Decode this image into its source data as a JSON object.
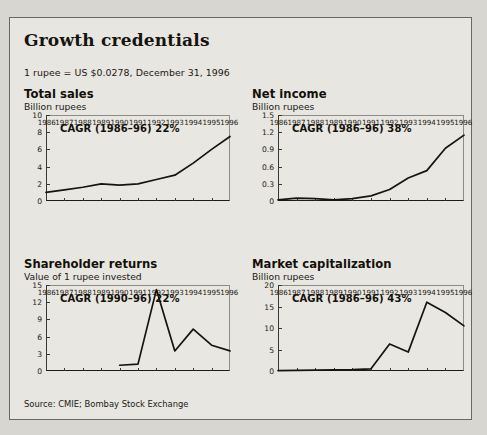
{
  "panel": {
    "title": "Growth credentials",
    "note": "1 rupee = US $0.0278, December 31, 1996",
    "source": "Source: CMIE; Bombay Stock Exchange"
  },
  "chart_data": [
    {
      "id": "total-sales",
      "type": "line",
      "title": "Total sales",
      "subtitle": "Billion rupees",
      "annotation": "CAGR (1986–96) 22%",
      "xlabel": "",
      "ylabel": "Billion rupees",
      "grid": false,
      "legend": "none",
      "ylim": [
        0,
        10
      ],
      "yticks": [
        0,
        2,
        4,
        6,
        8,
        10
      ],
      "ytick_labels": [
        "0",
        "2",
        "4",
        "6",
        "8",
        "10"
      ],
      "categories": [
        1986,
        1987,
        1988,
        1989,
        1990,
        1991,
        1992,
        1993,
        1994,
        1995,
        1996
      ],
      "tick_labels": [
        "1986",
        "1987",
        "1988",
        "1989",
        "1990",
        "1991",
        "1992",
        "1993",
        "1994",
        "1995",
        "1996"
      ],
      "values": [
        1.0,
        1.3,
        1.6,
        2.0,
        1.85,
        2.0,
        2.5,
        3.0,
        4.4,
        6.0,
        7.5
      ]
    },
    {
      "id": "net-income",
      "type": "line",
      "title": "Net income",
      "subtitle": "Billion rupees",
      "annotation": "CAGR (1986–96) 38%",
      "xlabel": "",
      "ylabel": "Billion rupees",
      "grid": false,
      "legend": "none",
      "ylim": [
        0,
        1.5
      ],
      "yticks": [
        0,
        0.3,
        0.6,
        0.9,
        1.2,
        1.5
      ],
      "ytick_labels": [
        "0",
        "0.3",
        "0.6",
        "0.9",
        "1.2",
        "1.5"
      ],
      "categories": [
        1986,
        1987,
        1988,
        1989,
        1990,
        1991,
        1992,
        1993,
        1994,
        1995,
        1996
      ],
      "tick_labels": [
        "1986",
        "1987",
        "1988",
        "1989",
        "1990",
        "1991",
        "1992",
        "1993",
        "1994",
        "1995",
        "1996"
      ],
      "values": [
        0.02,
        0.05,
        0.04,
        0.02,
        0.04,
        0.09,
        0.2,
        0.4,
        0.53,
        0.92,
        1.15
      ]
    },
    {
      "id": "shareholder-returns",
      "type": "line",
      "title": "Shareholder returns",
      "subtitle": "Value of 1 rupee invested",
      "annotation": "CAGR (1990–96) 22%",
      "xlabel": "",
      "ylabel": "Value of 1 rupee invested",
      "grid": false,
      "legend": "none",
      "ylim": [
        0,
        15
      ],
      "yticks": [
        0,
        3,
        6,
        9,
        12,
        15
      ],
      "ytick_labels": [
        "0",
        "3",
        "6",
        "9",
        "12",
        "15"
      ],
      "categories": [
        1986,
        1987,
        1988,
        1989,
        1990,
        1991,
        1992,
        1993,
        1994,
        1995,
        1996
      ],
      "tick_labels": [
        "1986",
        "1987",
        "1988",
        "1989",
        "1990",
        "1991",
        "1992",
        "1993",
        "1994",
        "1995",
        "1996"
      ],
      "values": [
        null,
        null,
        null,
        null,
        1.0,
        1.2,
        14.2,
        3.5,
        7.3,
        4.5,
        3.5
      ]
    },
    {
      "id": "market-capitalization",
      "type": "line",
      "title": "Market capitalization",
      "subtitle": "Billion rupees",
      "annotation": "CAGR (1986–96) 43%",
      "xlabel": "",
      "ylabel": "Billion rupees",
      "grid": false,
      "legend": "none",
      "ylim": [
        0,
        20
      ],
      "yticks": [
        0,
        5,
        10,
        15,
        20
      ],
      "ytick_labels": [
        "0",
        "5",
        "10",
        "15",
        "20"
      ],
      "categories": [
        1986,
        1987,
        1988,
        1989,
        1990,
        1991,
        1992,
        1993,
        1994,
        1995,
        1996
      ],
      "tick_labels": [
        "1986",
        "1987",
        "1988",
        "1989",
        "1990",
        "1991",
        "1992",
        "1993",
        "1994",
        "1995",
        "1996"
      ],
      "values": [
        0.1,
        0.15,
        0.2,
        0.25,
        0.3,
        0.5,
        6.3,
        4.4,
        16.0,
        13.6,
        10.5
      ]
    }
  ]
}
